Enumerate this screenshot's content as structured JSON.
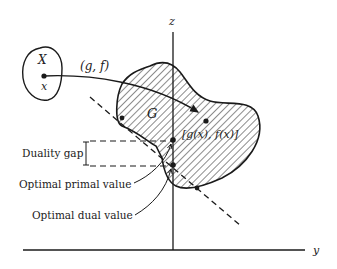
{
  "diagram": {
    "axes": {
      "vertical_label": "z",
      "horizontal_label": "y"
    },
    "sets": {
      "domain_set_label": "X",
      "domain_point_label": "x",
      "image_set_label": "G"
    },
    "mapping_label": "(g, f)",
    "image_point_label": "[g(x), f(x)]",
    "annotations": {
      "duality_gap": "Duality gap",
      "optimal_primal": "Optimal primal value",
      "optimal_dual": "Optimal dual value"
    },
    "colors": {
      "stroke": "#1a1a1a",
      "text": "#222222",
      "background": "#ffffff"
    }
  }
}
